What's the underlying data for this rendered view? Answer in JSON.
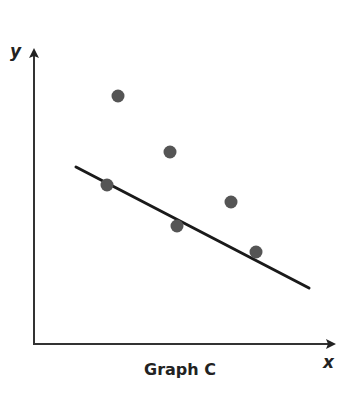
{
  "chart_data": {
    "type": "scatter",
    "title": "Graph C",
    "xlabel": "x",
    "ylabel": "y",
    "grid": false,
    "ticks": false,
    "points": [
      {
        "x": 118,
        "y": 96
      },
      {
        "x": 170,
        "y": 152
      },
      {
        "x": 107,
        "y": 185
      },
      {
        "x": 177,
        "y": 226
      },
      {
        "x": 231,
        "y": 202
      },
      {
        "x": 256,
        "y": 252
      }
    ],
    "trend_line": {
      "x1": 76,
      "y1": 167,
      "x2": 309,
      "y2": 288,
      "direction": "negative"
    },
    "note": "Point coordinates are in pixel space; no numeric axis scale shown. Line of best fit with negative slope."
  },
  "labels": {
    "y_axis": "y",
    "x_axis": "x",
    "caption": "Graph C"
  },
  "colors": {
    "point": "#555555",
    "line": "#1a1a1a",
    "axis": "#333333"
  }
}
